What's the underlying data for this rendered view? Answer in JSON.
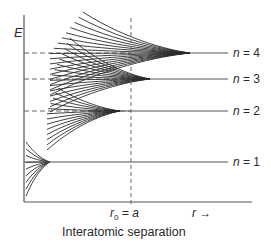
{
  "figure": {
    "type": "energy-level splitting diagram",
    "y_axis_label": "E",
    "x_axis_label": "r",
    "x_axis_arrow": "→",
    "equilibrium_label": {
      "symbol": "r",
      "subscript": "0",
      "equals": "= a"
    },
    "caption": "Interatomic separation",
    "colors": {
      "line": "#2a2a2a",
      "axis": "#555555",
      "dash": "#666666",
      "background": "#ffffff"
    }
  },
  "levels": [
    {
      "n": 1,
      "label_var": "n",
      "label_eq": "= 1",
      "y": 162,
      "converge_x": 50,
      "fan_start_x": 26,
      "fan_top": 142,
      "fan_bottom": 196,
      "curve_count": 9,
      "dashed": false
    },
    {
      "n": 2,
      "label_var": "n",
      "label_eq": "= 2",
      "y": 111,
      "converge_x": 120,
      "fan_start_x": 47,
      "fan_top": 88,
      "fan_bottom": 150,
      "curve_count": 13,
      "dashed": true
    },
    {
      "n": 3,
      "label_var": "n",
      "label_eq": "= 3",
      "y": 79,
      "converge_x": 150,
      "fan_start_x": 50,
      "fan_top": 38,
      "fan_bottom": 112,
      "curve_count": 15,
      "dashed": true
    },
    {
      "n": 4,
      "label_var": "n",
      "label_eq": "= 4",
      "y": 53,
      "converge_x": 190,
      "fan_start_x": 50,
      "fan_top": 12,
      "fan_bottom": 95,
      "curve_count": 17,
      "dashed": true
    }
  ],
  "axes": {
    "origin_x": 24,
    "origin_y": 202,
    "top_y": 15,
    "right_x": 252,
    "r0_x": 131,
    "level_end_x": 228
  }
}
